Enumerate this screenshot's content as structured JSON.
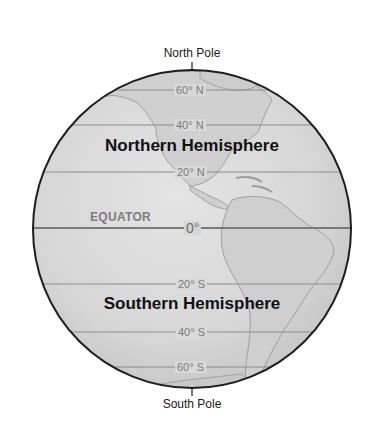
{
  "diagram": {
    "poles": {
      "north": "North Pole",
      "south": "South Pole"
    },
    "hemispheres": {
      "northern": "Northern Hemisphere",
      "southern": "Southern Hemisphere"
    },
    "equator": {
      "label": "EQUATOR",
      "degree": "0°"
    },
    "latitudes": [
      {
        "label": "60° N",
        "y": 90
      },
      {
        "label": "40° N",
        "y": 125
      },
      {
        "label": "20° N",
        "y": 172
      },
      {
        "label": "20° S",
        "y": 284
      },
      {
        "label": "40° S",
        "y": 332
      },
      {
        "label": "60° S",
        "y": 367
      }
    ],
    "colors": {
      "globe_fill": "#d9d9d9",
      "land_fill": "#cfcfcf",
      "land_stroke": "#9a9a9a",
      "globe_outline": "#1e1e1e",
      "latitude_line": "#8c8c8c",
      "equator_line": "#7a7a7a"
    }
  }
}
